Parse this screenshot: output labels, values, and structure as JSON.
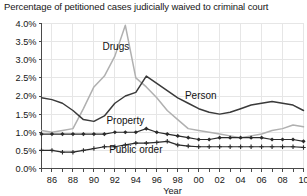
{
  "chart_data": {
    "type": "line",
    "title": "Percentage of petitioned cases judicially waived to criminal court",
    "xlabel": "Year",
    "ylabel": "",
    "xlim": [
      1985,
      2010
    ],
    "ylim": [
      0.0,
      4.0
    ],
    "grid": true,
    "legend_position": "inline-annotations",
    "ytick_labels": [
      "0.0%",
      "0.5%",
      "1.0%",
      "1.5%",
      "2.0%",
      "2.5%",
      "3.0%",
      "3.5%",
      "4.0%"
    ],
    "ytick_values": [
      0.0,
      0.5,
      1.0,
      1.5,
      2.0,
      2.5,
      3.0,
      3.5,
      4.0
    ],
    "xtick_labels": [
      "86",
      "88",
      "90",
      "92",
      "94",
      "96",
      "98",
      "00",
      "02",
      "04",
      "06",
      "08",
      "10"
    ],
    "xtick_values": [
      1986,
      1988,
      1990,
      1992,
      1994,
      1996,
      1998,
      2000,
      2002,
      2004,
      2006,
      2008,
      2010
    ],
    "x": [
      1985,
      1986,
      1987,
      1988,
      1989,
      1990,
      1991,
      1992,
      1993,
      1994,
      1995,
      1996,
      1997,
      1998,
      1999,
      2000,
      2001,
      2002,
      2003,
      2004,
      2005,
      2006,
      2007,
      2008,
      2009,
      2010
    ],
    "series": [
      {
        "name": "Drugs",
        "color": "#b0b0b0",
        "marker": "none",
        "label_x": 1992.1,
        "label_y": 3.28,
        "values": [
          1.05,
          1.0,
          1.05,
          1.1,
          1.65,
          2.25,
          2.55,
          3.1,
          3.95,
          2.5,
          2.25,
          1.95,
          1.6,
          1.35,
          1.1,
          1.05,
          1.0,
          0.95,
          0.9,
          0.85,
          0.9,
          0.95,
          1.05,
          1.1,
          1.2,
          1.15
        ]
      },
      {
        "name": "Person",
        "color": "#3a3a3a",
        "marker": "none",
        "label_x": 2000.2,
        "label_y": 1.93,
        "values": [
          1.95,
          1.9,
          1.8,
          1.6,
          1.35,
          1.3,
          1.45,
          1.8,
          2.0,
          2.1,
          2.55,
          2.35,
          2.15,
          1.95,
          1.8,
          1.65,
          1.55,
          1.5,
          1.55,
          1.65,
          1.75,
          1.8,
          1.85,
          1.8,
          1.75,
          1.6
        ]
      },
      {
        "name": "Property",
        "color": "#2b2b2b",
        "marker": "diamond",
        "label_x": 1993.0,
        "label_y": 1.23,
        "values": [
          0.95,
          0.95,
          0.95,
          0.95,
          0.95,
          0.95,
          0.95,
          1.0,
          1.0,
          1.0,
          1.1,
          1.0,
          0.95,
          0.9,
          0.85,
          0.8,
          0.8,
          0.85,
          0.85,
          0.85,
          0.85,
          0.85,
          0.8,
          0.8,
          0.8,
          0.75
        ]
      },
      {
        "name": "Public order",
        "color": "#2b2b2b",
        "marker": "plus",
        "label_x": 1994.0,
        "label_y": 0.42,
        "values": [
          0.5,
          0.5,
          0.45,
          0.45,
          0.5,
          0.55,
          0.6,
          0.6,
          0.65,
          0.7,
          0.7,
          0.72,
          0.75,
          0.65,
          0.62,
          0.6,
          0.6,
          0.6,
          0.6,
          0.6,
          0.6,
          0.6,
          0.6,
          0.6,
          0.6,
          0.58
        ]
      }
    ]
  }
}
